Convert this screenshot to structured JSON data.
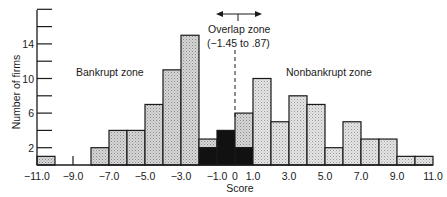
{
  "chart_data": {
    "type": "bar",
    "title": "",
    "xlabel": "Score",
    "ylabel": "Number of firms",
    "xlim": [
      -11.0,
      11.0
    ],
    "ylim": [
      0,
      18
    ],
    "x_tick_labels": [
      "-11.0",
      "-9.0",
      "-7.0",
      "-5.0",
      "-3.0",
      "-1.0",
      "0",
      "1.0",
      "3.0",
      "5.0",
      "7.0",
      "9.0",
      "11.0"
    ],
    "x_ticks": [
      -11,
      -9,
      -7,
      -5,
      -3,
      -1,
      0,
      1,
      3,
      5,
      7,
      9,
      11
    ],
    "y_tick_labels": [
      "2",
      "6",
      "10",
      "14"
    ],
    "y_ticks_labeled": [
      2,
      6,
      10,
      14
    ],
    "y_ticks_all": [
      2,
      4,
      6,
      8,
      10,
      12,
      14,
      16,
      18
    ],
    "grid": false,
    "legend": null,
    "bins": [
      {
        "from": -11,
        "to": -10,
        "nonbankrupt": 0,
        "bankrupt": 1
      },
      {
        "from": -8,
        "to": -7,
        "nonbankrupt": 0,
        "bankrupt": 2
      },
      {
        "from": -7,
        "to": -6,
        "nonbankrupt": 0,
        "bankrupt": 4
      },
      {
        "from": -6,
        "to": -5,
        "nonbankrupt": 0,
        "bankrupt": 4
      },
      {
        "from": -5,
        "to": -4,
        "nonbankrupt": 0,
        "bankrupt": 7
      },
      {
        "from": -4,
        "to": -3,
        "nonbankrupt": 0,
        "bankrupt": 11
      },
      {
        "from": -3,
        "to": -2,
        "nonbankrupt": 0,
        "bankrupt": 15
      },
      {
        "from": -2,
        "to": -1,
        "nonbankrupt": 1,
        "bankrupt": 2,
        "misclassified_dark": 2
      },
      {
        "from": -1,
        "to": 0,
        "nonbankrupt": 0,
        "bankrupt": 4,
        "misclassified_dark": 4
      },
      {
        "from": 0,
        "to": 1,
        "nonbankrupt": 4,
        "bankrupt": 2,
        "misclassified_dark": 2
      },
      {
        "from": 1,
        "to": 2,
        "nonbankrupt": 10,
        "bankrupt": 0
      },
      {
        "from": 2,
        "to": 3,
        "nonbankrupt": 5,
        "bankrupt": 0
      },
      {
        "from": 3,
        "to": 4,
        "nonbankrupt": 8,
        "bankrupt": 0
      },
      {
        "from": 4,
        "to": 5,
        "nonbankrupt": 7,
        "bankrupt": 0
      },
      {
        "from": 5,
        "to": 6,
        "nonbankrupt": 2,
        "bankrupt": 0
      },
      {
        "from": 6,
        "to": 7,
        "nonbankrupt": 5,
        "bankrupt": 0
      },
      {
        "from": 7,
        "to": 8,
        "nonbankrupt": 3,
        "bankrupt": 0
      },
      {
        "from": 8,
        "to": 9,
        "nonbankrupt": 3,
        "bankrupt": 0
      },
      {
        "from": 9,
        "to": 10,
        "nonbankrupt": 1,
        "bankrupt": 0
      },
      {
        "from": 10,
        "to": 11,
        "nonbankrupt": 1,
        "bankrupt": 0
      }
    ],
    "series": [
      {
        "name": "Bar total height (number of firms)",
        "x": [
          -10.5,
          -7.5,
          -6.5,
          -5.5,
          -4.5,
          -3.5,
          -2.5,
          -1.5,
          -0.5,
          0.5,
          1.5,
          2.5,
          3.5,
          4.5,
          5.5,
          6.5,
          7.5,
          8.5,
          9.5,
          10.5
        ],
        "values": [
          1,
          2,
          4,
          4,
          7,
          11,
          15,
          3,
          4,
          6,
          10,
          5,
          8,
          7,
          2,
          5,
          3,
          3,
          1,
          1
        ]
      },
      {
        "name": "Black (overlap) segment",
        "x": [
          -1.5,
          -0.5,
          0.5
        ],
        "values": [
          2,
          4,
          2
        ]
      }
    ],
    "annotations": [
      {
        "text": "Bankrupt zone",
        "x": -7.5,
        "y": 10.8
      },
      {
        "text": "Nonbankrupt zone",
        "x": 5.2,
        "y": 10.8
      },
      {
        "text": "Overlap zone",
        "x": 0,
        "y": 16.7
      },
      {
        "text": "(−1.45 to .87)",
        "x": 0,
        "y": 15.3
      },
      {
        "type": "double-arrow",
        "from": -1.45,
        "to": 0.87,
        "y": 18
      },
      {
        "type": "dashed-vertical-line",
        "x": 0
      }
    ],
    "colors": {
      "bar_fill": "#c9c9c9",
      "bar_fill_light": "#dcdcdc",
      "overlap_fill": "#111111",
      "stroke": "#1a1a1a"
    }
  },
  "labels": {
    "ylabel": "Number of firms",
    "xlabel": "Score",
    "bankrupt_zone": "Bankrupt zone",
    "nonbankrupt_zone": "Nonbankrupt zone",
    "overlap_title": "Overlap zone",
    "overlap_range": "(−1.45 to .87)"
  }
}
